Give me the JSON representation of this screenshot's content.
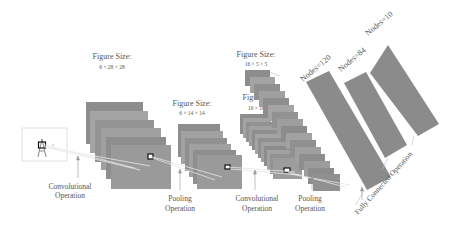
{
  "diagram": {
    "input": {
      "label": "Input:",
      "size": "32 × 32"
    },
    "layers": [
      {
        "id": "c1",
        "label": "Figure Size:",
        "size": "6 × 28 × 28"
      },
      {
        "id": "s2",
        "label": "Figure Size:",
        "size": "6 × 14 × 14"
      },
      {
        "id": "c3",
        "label": "Figure Size:",
        "size": "16 × 10 × 10"
      },
      {
        "id": "s4",
        "label": "Figure Size:",
        "size": "16 × 5 × 5"
      }
    ],
    "fc": [
      {
        "id": "f5",
        "label": "Nodes=120"
      },
      {
        "id": "f6",
        "label": "Nodes=84"
      },
      {
        "id": "out",
        "label": "Nodes=10"
      }
    ],
    "operations": {
      "conv1_l1": "Convolutional",
      "conv1_l2": "Operation",
      "pool1_l1": "Pooling",
      "pool1_l2": "Operation",
      "conv2_l1": "Convolutional",
      "conv2_l2": "Operation",
      "pool2_l1": "Pooling",
      "pool2_l2": "Operation",
      "fc": "Fully Connected Operation"
    },
    "colors": {
      "map": "#8f8f8f",
      "map_alt": "#a2a2a2",
      "fc": "#8c8c8c",
      "edge": "#6e6e6e"
    }
  }
}
